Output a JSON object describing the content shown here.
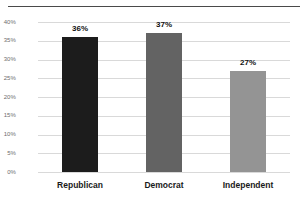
{
  "chart_data": {
    "type": "bar",
    "title": "",
    "xlabel": "",
    "ylabel": "",
    "categories": [
      "Republican",
      "Democrat",
      "Independent"
    ],
    "values": [
      36,
      37,
      27
    ],
    "value_labels": [
      "36%",
      "37%",
      "27%"
    ],
    "bar_colors": [
      "#1c1c1c",
      "#636363",
      "#949494"
    ],
    "ylim": [
      0,
      40
    ],
    "ytick_labels": [
      "0%",
      "5%",
      "10%",
      "15%",
      "20%",
      "25%",
      "30%",
      "35%",
      "40%"
    ],
    "ytick_values": [
      0,
      5,
      10,
      15,
      20,
      25,
      30,
      35,
      40
    ],
    "grid": true,
    "gridline_color": "#d9d9d9",
    "legend": null,
    "background": "#ffffff",
    "top_rule_color": "#4a4a4a"
  }
}
